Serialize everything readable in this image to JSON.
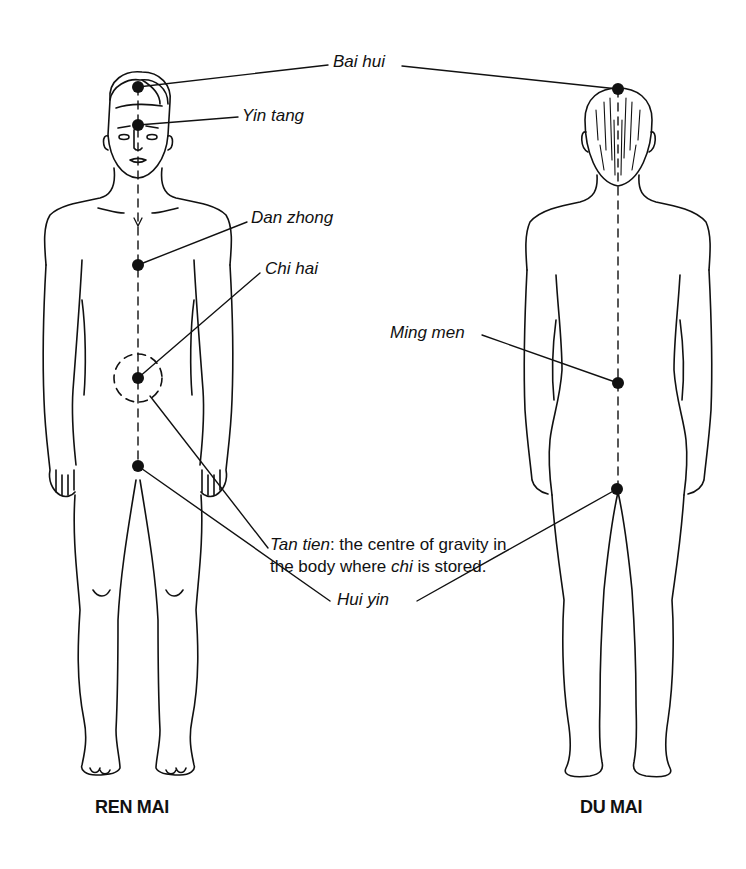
{
  "figures": {
    "front": {
      "title": "REN MAI",
      "view": "front"
    },
    "back": {
      "title": "DU MAI",
      "view": "back"
    }
  },
  "points": {
    "bai_hui": "Bai hui",
    "yin_tang": "Yin tang",
    "dan_zhong": "Dan zhong",
    "chi_hai": "Chi hai",
    "ming_men": "Ming men",
    "hui_yin": "Hui yin"
  },
  "tan_tien": {
    "term": "Tan tien",
    "desc_part1": ": the centre of gravity in the body where ",
    "chi_term": "chi",
    "desc_part2": " is stored."
  },
  "colors": {
    "ink": "#111111",
    "background": "#ffffff"
  }
}
